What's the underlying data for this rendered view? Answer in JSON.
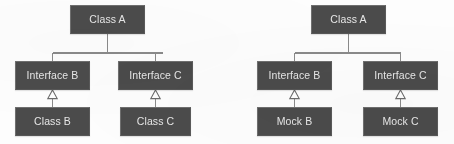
{
  "canvas": {
    "width": 454,
    "height": 144,
    "background_color": "#fdfdfd"
  },
  "style": {
    "node_fill": "#4b4b4b",
    "node_border": "#6f6f6f",
    "node_text_color": "#e6e6e6",
    "connector_color": "#8a8a8a",
    "arrowhead_fill": "#fdfdfd",
    "arrowhead_stroke": "#6b6b6b"
  },
  "diagrams": [
    {
      "id": "production-diagram",
      "name": "left-diagram",
      "nodes": {
        "root": {
          "label": "Class A",
          "x": 70,
          "y": 5,
          "w": 75,
          "h": 29
        },
        "interface_left": {
          "label": "Interface B",
          "x": 15,
          "y": 61,
          "w": 75,
          "h": 29
        },
        "interface_right": {
          "label": "Interface C",
          "x": 118,
          "y": 61,
          "w": 75,
          "h": 29
        },
        "impl_left": {
          "label": "Class B",
          "x": 15,
          "y": 107,
          "w": 75,
          "h": 29
        },
        "impl_right": {
          "label": "Class C",
          "x": 120,
          "y": 107,
          "w": 71,
          "h": 29
        }
      }
    },
    {
      "id": "test-diagram",
      "name": "right-diagram",
      "nodes": {
        "root": {
          "label": "Class A",
          "x": 84,
          "y": 5,
          "w": 75,
          "h": 29
        },
        "interface_left": {
          "label": "Interface B",
          "x": 30,
          "y": 61,
          "w": 75,
          "h": 29
        },
        "interface_right": {
          "label": "Interface C",
          "x": 136,
          "y": 61,
          "w": 75,
          "h": 29
        },
        "impl_left": {
          "label": "Mock B",
          "x": 30,
          "y": 107,
          "w": 75,
          "h": 29
        },
        "impl_right": {
          "label": "Mock C",
          "x": 136,
          "y": 107,
          "w": 75,
          "h": 29
        }
      }
    }
  ],
  "relationships": [
    {
      "from": "root",
      "to": "interface_left",
      "type": "association"
    },
    {
      "from": "root",
      "to": "interface_right",
      "type": "association"
    },
    {
      "from": "impl_left",
      "to": "interface_left",
      "type": "realization"
    },
    {
      "from": "impl_right",
      "to": "interface_right",
      "type": "realization"
    }
  ]
}
